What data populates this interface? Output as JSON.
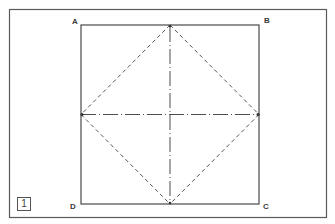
{
  "figure": {
    "step_number": "1",
    "corners": {
      "top_left": "A",
      "top_right": "B",
      "bottom_right": "C",
      "bottom_left": "D"
    },
    "colors": {
      "background": "#ffffff",
      "frame": "#5a5a5a",
      "square": "#4a4a4a",
      "dashed": "#555555",
      "dash_dot": "#4d4d4d"
    },
    "geometry": {
      "outer_frame": {
        "x": 9.5,
        "y": 9.5,
        "w": 317,
        "h": 208
      },
      "square": {
        "x": 81,
        "y": 25,
        "w": 178,
        "h": 179
      },
      "center": {
        "x": 170,
        "y": 114.5
      }
    },
    "lines": [
      {
        "type": "solid",
        "description": "square outline"
      },
      {
        "type": "dashed",
        "description": "diamond connecting edge midpoints"
      },
      {
        "type": "dash-dot",
        "description": "vertical center line"
      },
      {
        "type": "dash-dot",
        "description": "horizontal center line"
      }
    ]
  }
}
